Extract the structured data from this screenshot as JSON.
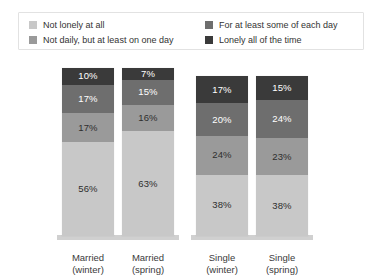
{
  "legend": {
    "items": [
      {
        "label": "Not lonely at all",
        "color": "#c8c8c8",
        "column": "left"
      },
      {
        "label": "Not daily, but at least on one day",
        "color": "#9a9a9a",
        "column": "left"
      },
      {
        "label": "For at least some of each day",
        "color": "#6e6e6e",
        "column": "right"
      },
      {
        "label": "Lonely all of the time",
        "color": "#3a3a3a",
        "column": "right"
      }
    ]
  },
  "chart_data": {
    "type": "bar",
    "stacked": true,
    "normalized_percent": true,
    "title": "",
    "xlabel": "",
    "ylabel": "",
    "ylim": [
      0,
      100
    ],
    "grid": false,
    "legend_position": "top",
    "categories": [
      "Married (winter)",
      "Married (spring)",
      "Single (winter)",
      "Single (spring)"
    ],
    "category_lines": [
      {
        "line1": "Married",
        "line2": "(winter)"
      },
      {
        "line1": "Married",
        "line2": "(spring)"
      },
      {
        "line1": "Single",
        "line2": "(winter)"
      },
      {
        "line1": "Single",
        "line2": "(spring)"
      }
    ],
    "series": [
      {
        "name": "Lonely all of the time",
        "color": "#3a3a3a",
        "values": [
          10,
          7,
          17,
          15
        ],
        "labels": [
          "10%",
          "7%",
          "17%",
          "15%"
        ]
      },
      {
        "name": "For at least some of each day",
        "color": "#6e6e6e",
        "values": [
          17,
          15,
          20,
          24
        ],
        "labels": [
          "17%",
          "15%",
          "20%",
          "24%"
        ]
      },
      {
        "name": "Not daily, but at least on one day",
        "color": "#9a9a9a",
        "values": [
          17,
          16,
          24,
          23
        ],
        "labels": [
          "17%",
          "16%",
          "24%",
          "23%"
        ]
      },
      {
        "name": "Not lonely at all",
        "color": "#c8c8c8",
        "values": [
          56,
          63,
          38,
          38
        ],
        "labels": [
          "56%",
          "63%",
          "38%",
          "38%"
        ]
      }
    ],
    "bar_heights_px": [
      168,
      168,
      160,
      160
    ]
  }
}
